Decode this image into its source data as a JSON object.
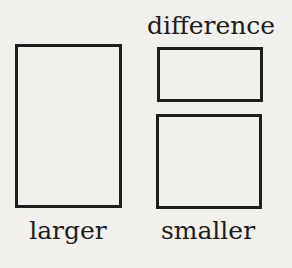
{
  "diagram": {
    "labels": {
      "larger": "larger",
      "smaller": "smaller",
      "difference": "difference"
    }
  }
}
